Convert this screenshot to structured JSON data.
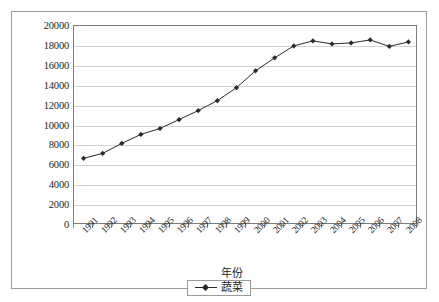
{
  "chart_data": {
    "type": "line",
    "title": "",
    "xlabel": "年份",
    "ylabel": "",
    "categories": [
      "1991",
      "1992",
      "1993",
      "1994",
      "1995",
      "1996",
      "1997",
      "1998",
      "1999",
      "2000",
      "2001",
      "2002",
      "2003",
      "2004",
      "2005",
      "2006",
      "2007",
      "2008"
    ],
    "series": [
      {
        "name": "蔬菜",
        "values": [
          6700,
          7200,
          8200,
          9100,
          9700,
          10600,
          11500,
          12500,
          13800,
          15500,
          16800,
          18000,
          18500,
          18200,
          18300,
          18600,
          17950,
          18400
        ],
        "color": "#2a2a2a",
        "marker": "diamond"
      }
    ],
    "ylim": [
      0,
      20000
    ],
    "ytick_step": 2000,
    "yticks": [
      "0",
      "2000",
      "4000",
      "6000",
      "8000",
      "10000",
      "12000",
      "14000",
      "16000",
      "18000",
      "20000"
    ],
    "grid": true,
    "grid_axis": "y",
    "legend_position": "bottom",
    "legend_entries": [
      "蔬菜"
    ]
  },
  "axes": {
    "x_title": "年份",
    "y_title": ""
  },
  "legend": {
    "label": "蔬菜"
  },
  "colors": {
    "series": "#2a2a2a",
    "grid": "#d2d2d2",
    "axis": "#7d7d7d",
    "frame": "#9a9a9a",
    "text": "#1c1c1c",
    "background": "#ffffff"
  }
}
